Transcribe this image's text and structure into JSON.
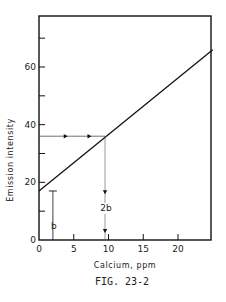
{
  "chart_data": {
    "type": "line",
    "title": "",
    "caption": "FIG. 23-2",
    "xlabel": "Calcium, ppm",
    "ylabel": "Emission intensity",
    "xlim": [
      0,
      25
    ],
    "ylim": [
      0,
      75
    ],
    "x_ticks": [
      0,
      5,
      10,
      15,
      20
    ],
    "x_tick_labels": [
      "0",
      "5",
      "10",
      "15",
      "20"
    ],
    "y_ticks": [
      0,
      10,
      20,
      30,
      40,
      50,
      60,
      70
    ],
    "y_tick_labels": [
      "0",
      "",
      "20",
      "",
      "40",
      "",
      "60",
      ""
    ],
    "grid": false,
    "legend": null,
    "series": [
      {
        "name": "calibration line",
        "x": [
          0,
          25
        ],
        "y": [
          17,
          66
        ]
      }
    ],
    "annotations": [
      {
        "type": "bracket",
        "label": "b",
        "x": 2,
        "y_from": 0,
        "y_to": 17
      },
      {
        "type": "arrow-horizontal",
        "x_from": 0,
        "x_to": 9.5,
        "y": 36
      },
      {
        "type": "arrow-vertical",
        "x": 9.5,
        "y_from": 36,
        "y_to": 0,
        "label": "2b"
      }
    ]
  }
}
